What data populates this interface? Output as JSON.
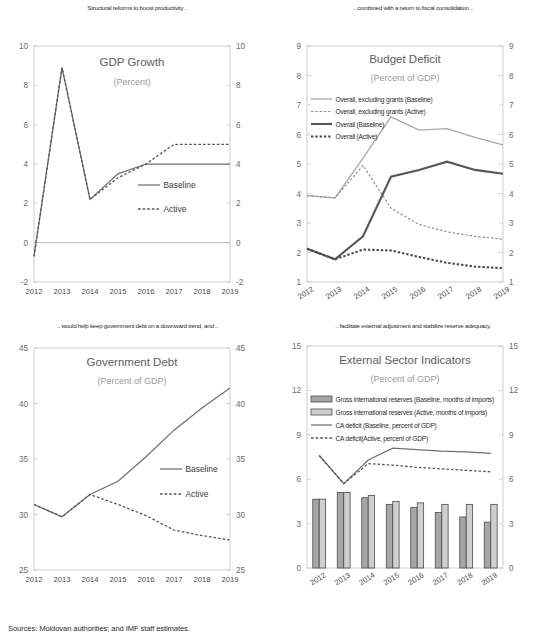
{
  "figure": {
    "source_note": "Sources: Moldovan authorities; and IMF staff estimates."
  },
  "panels": {
    "gdp": {
      "caption": "Structural reforms to boost productivity ..",
      "title": "GDP Growth",
      "subtitle": "(Percent)",
      "legend": [
        "Baseline",
        "Active"
      ]
    },
    "deficit": {
      "caption": ".. combined with a return to fiscal consolidation ..",
      "title": "Budget Deficit",
      "subtitle": "(Percent of GDP)",
      "legend": [
        "Overall, excluding grants (Baseline)",
        "Overall, excluding grants (Active)",
        "Overall (Baseline)",
        "Overall (Active)"
      ]
    },
    "debt": {
      "caption": ".. would help keep government debt on a downward trend, and ..",
      "title": "Government Debt",
      "subtitle": "(Percent of GDP)",
      "legend": [
        "Baseline",
        "Active"
      ]
    },
    "external": {
      "caption": ".. facilitate external adjustment and stabilize reserve adequacy.",
      "title": "External Sector Indicators",
      "subtitle": "(Percent of GDP)",
      "legend": [
        "Gross international reserves (Baseline, months of imports)",
        "Gross international reserves (Active, months of imports)",
        "CA deficit (Baseline, percent of GDP)",
        "CA deficit(Active, percent of GDP)"
      ]
    }
  },
  "chart_data": [
    {
      "id": "gdp",
      "type": "line",
      "title": "GDP Growth",
      "subtitle": "(Percent)",
      "xlabel": "",
      "ylabel": "",
      "x": [
        "2012",
        "2013",
        "2014",
        "2015",
        "2016",
        "2017",
        "2018",
        "2019"
      ],
      "ylim": [
        -2,
        10
      ],
      "yticks": [
        -2,
        0,
        2,
        4,
        6,
        8,
        10
      ],
      "grid": false,
      "legend_position": "inside-right",
      "series": [
        {
          "name": "Baseline",
          "style": "solid",
          "values": [
            -0.7,
            8.9,
            2.2,
            3.5,
            4.0,
            4.0,
            4.0,
            4.0
          ]
        },
        {
          "name": "Active",
          "style": "dotted",
          "values": [
            -0.7,
            8.9,
            2.2,
            3.3,
            4.0,
            5.0,
            5.0,
            5.0
          ]
        }
      ]
    },
    {
      "id": "deficit",
      "type": "line",
      "title": "Budget Deficit",
      "subtitle": "(Percent of GDP)",
      "xlabel": "",
      "ylabel": "",
      "x": [
        "2012",
        "2013",
        "2014",
        "2015",
        "2016",
        "2017",
        "2018",
        "2019"
      ],
      "ylim": [
        1,
        9
      ],
      "yticks": [
        1,
        2,
        3,
        4,
        5,
        6,
        7,
        8,
        9
      ],
      "grid": false,
      "legend_position": "inside-top-left",
      "series": [
        {
          "name": "Overall, excluding grants (Baseline)",
          "style": "solid-light",
          "values": [
            3.93,
            3.85,
            5.2,
            6.6,
            6.15,
            6.2,
            5.9,
            5.65
          ]
        },
        {
          "name": "Overall, excluding grants (Active)",
          "style": "dotted-light",
          "values": [
            3.93,
            3.85,
            4.95,
            3.5,
            2.95,
            2.7,
            2.55,
            2.45
          ]
        },
        {
          "name": "Overall (Baseline)",
          "style": "solid-thick",
          "values": [
            2.13,
            1.77,
            2.55,
            4.57,
            4.8,
            5.08,
            4.8,
            4.67
          ]
        },
        {
          "name": "Overall (Active)",
          "style": "dotted-thick",
          "values": [
            2.13,
            1.77,
            2.1,
            2.07,
            1.85,
            1.65,
            1.52,
            1.47
          ]
        }
      ]
    },
    {
      "id": "debt",
      "type": "line",
      "title": "Government Debt",
      "subtitle": "(Percent of GDP)",
      "xlabel": "",
      "ylabel": "",
      "x": [
        "2012",
        "2013",
        "2014",
        "2015",
        "2016",
        "2017",
        "2018",
        "2019"
      ],
      "ylim": [
        25,
        45
      ],
      "yticks": [
        25,
        30,
        35,
        40,
        45
      ],
      "grid": false,
      "legend_position": "inside-right",
      "series": [
        {
          "name": "Baseline",
          "style": "solid",
          "values": [
            30.9,
            29.8,
            31.8,
            33.0,
            35.2,
            37.6,
            39.6,
            41.4
          ]
        },
        {
          "name": "Active",
          "style": "dotted",
          "values": [
            30.9,
            29.8,
            31.8,
            30.9,
            29.9,
            28.6,
            28.1,
            27.7
          ]
        }
      ]
    },
    {
      "id": "external",
      "type": "bar+line",
      "title": "External Sector Indicators",
      "subtitle": "(Percent of GDP)",
      "xlabel": "",
      "ylabel": "",
      "x": [
        "2012",
        "2013",
        "2014",
        "2015",
        "2016",
        "2017",
        "2018",
        "2019"
      ],
      "ylim": [
        0,
        15
      ],
      "yticks": [
        0,
        3,
        6,
        9,
        12,
        15
      ],
      "grid": false,
      "legend_position": "inside-top-left",
      "bars": [
        {
          "name": "Gross international reserves (Baseline, months of imports)",
          "values": [
            4.65,
            5.1,
            4.75,
            4.3,
            4.1,
            3.75,
            3.45,
            3.1
          ]
        },
        {
          "name": "Gross international reserves (Active, months of imports)",
          "values": [
            4.65,
            5.1,
            4.9,
            4.5,
            4.4,
            4.3,
            4.3,
            4.3
          ]
        }
      ],
      "series": [
        {
          "name": "CA deficit (Baseline, percent of GDP)",
          "style": "solid",
          "values": [
            7.6,
            5.7,
            7.3,
            8.1,
            8.0,
            7.9,
            7.85,
            7.75
          ]
        },
        {
          "name": "CA deficit(Active, percent of GDP)",
          "style": "dotted",
          "values": [
            7.6,
            5.7,
            7.05,
            6.95,
            6.8,
            6.7,
            6.6,
            6.5
          ]
        }
      ]
    }
  ]
}
